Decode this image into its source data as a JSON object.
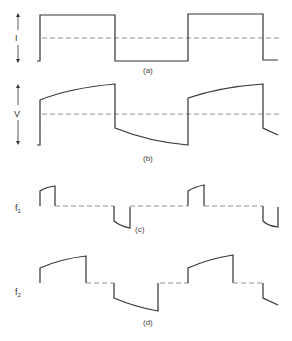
{
  "figure": {
    "panels": [
      {
        "id": "a",
        "caption": "(a)",
        "axis_label": "I",
        "description": "Square-wave current"
      },
      {
        "id": "b",
        "caption": "(b)",
        "axis_label": "V",
        "description": "Voltage with exponential rise/decay segments"
      },
      {
        "id": "c",
        "caption": "(c)",
        "axis_label": "f",
        "axis_sub": "1",
        "description": "Component f1: short pulses at transitions"
      },
      {
        "id": "d",
        "caption": "(d)",
        "axis_label": "f",
        "axis_sub": "2",
        "description": "Component f2: longer pulses at transitions"
      }
    ],
    "colors": {
      "line": "#333333",
      "dashed": "#777777",
      "background": "#ffffff"
    }
  }
}
